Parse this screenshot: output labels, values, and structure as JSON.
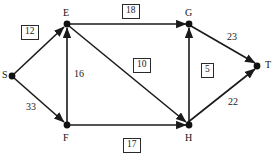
{
  "diagram": {
    "type": "directed-network-graph",
    "width": 277,
    "height": 160,
    "background_color": "#ffffff",
    "stroke_color": "#1a1a1a",
    "nodes": [
      {
        "id": "S",
        "label": "S",
        "x": 12,
        "y": 76,
        "label_x": 2,
        "label_y": 70
      },
      {
        "id": "E",
        "label": "E",
        "x": 67,
        "y": 24,
        "label_x": 63,
        "label_y": 8
      },
      {
        "id": "F",
        "label": "F",
        "x": 67,
        "y": 125,
        "label_x": 63,
        "label_y": 133
      },
      {
        "id": "G",
        "label": "G",
        "x": 189,
        "y": 24,
        "label_x": 185,
        "label_y": 8
      },
      {
        "id": "H",
        "label": "H",
        "x": 189,
        "y": 125,
        "label_x": 185,
        "label_y": 133
      },
      {
        "id": "T",
        "label": "T",
        "x": 257,
        "y": 66,
        "label_x": 265,
        "label_y": 60
      }
    ],
    "edges": [
      {
        "from": "S",
        "to": "E",
        "weight": "12",
        "boxed": true,
        "label_x": 21,
        "label_y": 25
      },
      {
        "from": "S",
        "to": "F",
        "weight": "33",
        "boxed": false,
        "label_x": 26,
        "label_y": 102
      },
      {
        "from": "F",
        "to": "E",
        "weight": "16",
        "boxed": false,
        "label_x": 74,
        "label_y": 69
      },
      {
        "from": "E",
        "to": "G",
        "weight": "18",
        "boxed": true,
        "label_x": 122,
        "label_y": 4
      },
      {
        "from": "E",
        "to": "H",
        "weight": "10",
        "boxed": true,
        "label_x": 133,
        "label_y": 58
      },
      {
        "from": "F",
        "to": "H",
        "weight": "17",
        "boxed": true,
        "label_x": 123,
        "label_y": 138
      },
      {
        "from": "H",
        "to": "G",
        "weight": "5",
        "boxed": true,
        "label_x": 201,
        "label_y": 63
      },
      {
        "from": "G",
        "to": "T",
        "weight": "23",
        "boxed": false,
        "label_x": 227,
        "label_y": 32
      },
      {
        "from": "H",
        "to": "T",
        "weight": "22",
        "boxed": false,
        "label_x": 228,
        "label_y": 97
      }
    ]
  }
}
